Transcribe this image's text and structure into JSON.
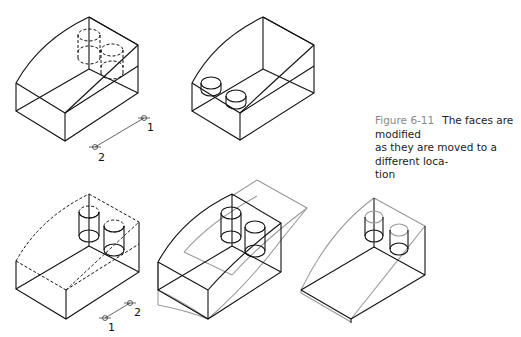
{
  "caption": {
    "figure_number": "Figure 6-11",
    "text_line1": "The faces are modified",
    "text_line2": "as they are moved to a different loca-",
    "text_line3": "tion",
    "accent_color": "#8a8a8a"
  },
  "figures": [
    {
      "id": "fig-a",
      "description": "solid wedge with two hidden (dashed) cylinders, displacement vector points",
      "points": {
        "p1": "1",
        "p2": "2"
      }
    },
    {
      "id": "fig-b",
      "description": "solid wedge with two cylinder holes on sloped face"
    },
    {
      "id": "fig-c",
      "description": "dashed wedge outline with two cylinders, displacement points",
      "points": {
        "p1": "1",
        "p2": "2"
      }
    },
    {
      "id": "fig-d",
      "description": "wedge with gray moved faces overlay"
    },
    {
      "id": "fig-e",
      "description": "result wedge with gray modified faces"
    }
  ],
  "colors": {
    "line": "#111111",
    "ghost": "#9a9a9a",
    "background": "#ffffff"
  }
}
